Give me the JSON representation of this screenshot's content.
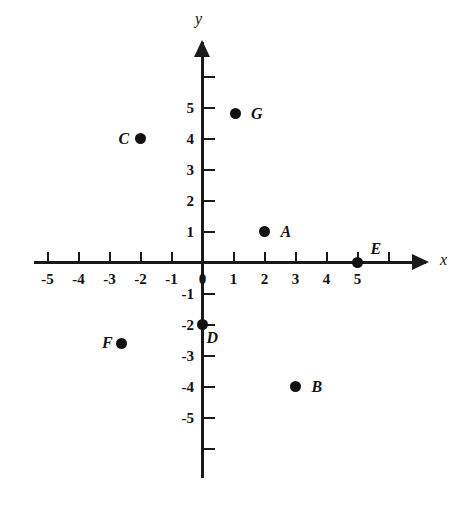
{
  "figure": {
    "title": "",
    "background_color": "#ffffff",
    "ink_color": "#111111"
  },
  "axes": {
    "x_label": "x",
    "y_label": "y",
    "x_tick_labels": [
      "-5",
      "-4",
      "-3",
      "-2",
      "-1",
      "0",
      "1",
      "2",
      "3",
      "4",
      "5"
    ],
    "y_tick_labels": [
      "5",
      "4",
      "3",
      "2",
      "1",
      "-1",
      "-2",
      "-3",
      "-4",
      "-5"
    ]
  },
  "chart_data": {
    "type": "scatter",
    "title": "",
    "xlabel": "x",
    "ylabel": "y",
    "xlim": [
      -6,
      7
    ],
    "ylim": [
      -7,
      6
    ],
    "grid": false,
    "legend": "none",
    "x_ticks": [
      -5,
      -4,
      -3,
      -2,
      -1,
      0,
      1,
      2,
      3,
      4,
      5
    ],
    "y_ticks": [
      5,
      4,
      3,
      2,
      1,
      -1,
      -2,
      -3,
      -4,
      -5
    ],
    "points": [
      {
        "label": "A",
        "x": 2,
        "y": 1,
        "label_dx": 16,
        "label_dy": -8
      },
      {
        "label": "B",
        "x": 3,
        "y": -4,
        "label_dx": 16,
        "label_dy": -8
      },
      {
        "label": "C",
        "x": -2,
        "y": 4,
        "label_dx": -22,
        "label_dy": -8
      },
      {
        "label": "D",
        "x": 0,
        "y": -2,
        "label_dx": 4,
        "label_dy": 5
      },
      {
        "label": "E",
        "x": 5,
        "y": 0,
        "label_dx": 13,
        "label_dy": -22
      },
      {
        "label": "F",
        "x": -2.6,
        "y": -2.6,
        "label_dx": -20,
        "label_dy": -8
      },
      {
        "label": "G",
        "x": 1.05,
        "y": 4.8,
        "label_dx": 16,
        "label_dy": -8
      }
    ]
  }
}
